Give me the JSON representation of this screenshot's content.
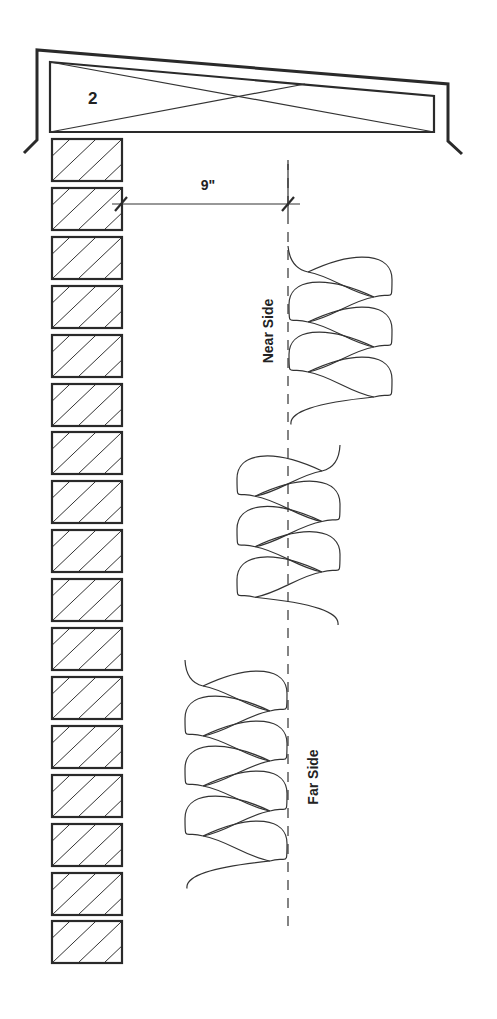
{
  "header_beam": {
    "label": "2",
    "outer_outline": [
      [
        24,
        153
      ],
      [
        37,
        140
      ],
      [
        37,
        50
      ],
      [
        448,
        84
      ],
      [
        448,
        141
      ],
      [
        462,
        154
      ]
    ],
    "inner_box": {
      "top_left": [
        50,
        62
      ],
      "top_right": [
        434,
        96
      ],
      "bottom_left": [
        50,
        132
      ],
      "bottom_right": [
        434,
        132
      ]
    },
    "cross_lines": [
      [
        [
          50,
          62
        ],
        [
          434,
          132
        ]
      ],
      [
        [
          50,
          132
        ],
        [
          305,
          84
        ]
      ]
    ],
    "label_pos": [
      88,
      104
    ]
  },
  "wall": {
    "brick_count": 17,
    "x": 52,
    "width": 70,
    "first_top": 139,
    "height": 42,
    "pitch": 48.9
  },
  "dimension": {
    "label": "9\"",
    "label_pos": [
      208,
      190
    ],
    "y": 204,
    "x_start": 112,
    "x_end": 300,
    "tick_left_x": 121,
    "tick_right_x": 288
  },
  "centerline": {
    "x": 288,
    "y_top": 160,
    "y_bottom": 926,
    "dash": "10 8"
  },
  "coils": [
    {
      "name": "near-side-coil",
      "left_x": 308,
      "right_x": 374,
      "outer_left": 289,
      "outer_right": 392,
      "first_cross_y": 272,
      "pitch": 50,
      "crossings": 6,
      "start": [
        288,
        246
      ],
      "start_side": "left"
    },
    {
      "name": "middle-coil",
      "left_x": 255,
      "right_x": 322,
      "outer_left": 237,
      "outer_right": 340,
      "first_cross_y": 471,
      "pitch": 50.5,
      "crossings": 6,
      "start": [
        340,
        445
      ],
      "start_side": "right"
    },
    {
      "name": "far-side-coil",
      "left_x": 203,
      "right_x": 270,
      "outer_left": 185,
      "outer_right": 287,
      "first_cross_y": 686,
      "pitch": 50,
      "crossings": 8,
      "start": [
        185,
        660
      ],
      "start_side": "left"
    }
  ],
  "labels": {
    "near_side": {
      "text": "Near Side",
      "pos": [
        268,
        331
      ]
    },
    "far_side": {
      "text": "Far Side",
      "pos": [
        313,
        777
      ]
    }
  }
}
